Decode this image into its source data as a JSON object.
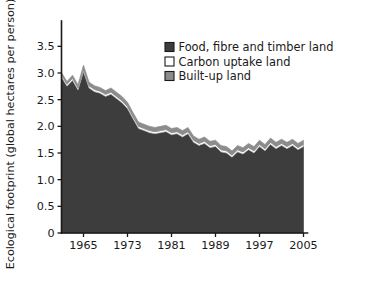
{
  "chart_data": {
    "type": "area",
    "stacked": true,
    "title": "",
    "subtitle": "",
    "xlabel": "",
    "ylabel": "Ecological footprint (global hectares per person)",
    "xlim": [
      1961,
      2005
    ],
    "ylim": [
      0,
      3.75
    ],
    "grid": false,
    "legend_position": "top-right",
    "y_ticks": [
      "0",
      "0.5",
      "1.0",
      "1.5",
      "2.0",
      "2.5",
      "3.0",
      "3.5"
    ],
    "y_tick_values": [
      0,
      0.5,
      1.0,
      1.5,
      2.0,
      2.5,
      3.0,
      3.5
    ],
    "x_ticks": [
      "1965",
      "1973",
      "1981",
      "1989",
      "1997",
      "2005"
    ],
    "x_tick_values": [
      1965,
      1973,
      1981,
      1989,
      1997,
      2005
    ],
    "x": [
      1961,
      1962,
      1963,
      1964,
      1965,
      1966,
      1967,
      1968,
      1969,
      1970,
      1971,
      1972,
      1973,
      1974,
      1975,
      1976,
      1977,
      1978,
      1979,
      1980,
      1981,
      1982,
      1983,
      1984,
      1985,
      1986,
      1987,
      1988,
      1989,
      1990,
      1991,
      1992,
      1993,
      1994,
      1995,
      1996,
      1997,
      1998,
      1999,
      2000,
      2001,
      2002,
      2003,
      2004,
      2005
    ],
    "series": [
      {
        "name": "Food, fibre and timber land",
        "color": "#3d3d3d",
        "values": [
          2.92,
          2.75,
          2.86,
          2.68,
          3.02,
          2.72,
          2.65,
          2.62,
          2.56,
          2.6,
          2.52,
          2.44,
          2.33,
          2.14,
          1.96,
          1.92,
          1.88,
          1.86,
          1.88,
          1.9,
          1.84,
          1.86,
          1.8,
          1.86,
          1.7,
          1.64,
          1.68,
          1.6,
          1.62,
          1.52,
          1.5,
          1.42,
          1.52,
          1.48,
          1.56,
          1.5,
          1.62,
          1.54,
          1.66,
          1.58,
          1.64,
          1.58,
          1.64,
          1.56,
          1.62
        ]
      },
      {
        "name": "Carbon uptake land",
        "color": "#ffffff",
        "values": [
          0.04,
          0.04,
          0.04,
          0.04,
          0.04,
          0.04,
          0.04,
          0.04,
          0.04,
          0.04,
          0.04,
          0.04,
          0.04,
          0.04,
          0.04,
          0.04,
          0.04,
          0.04,
          0.04,
          0.04,
          0.04,
          0.04,
          0.04,
          0.04,
          0.04,
          0.04,
          0.04,
          0.04,
          0.04,
          0.04,
          0.04,
          0.04,
          0.04,
          0.04,
          0.04,
          0.04,
          0.04,
          0.04,
          0.04,
          0.04,
          0.04,
          0.04,
          0.04,
          0.04,
          0.04
        ]
      },
      {
        "name": "Built-up land",
        "color": "#8c8c8c",
        "values": [
          0.05,
          0.05,
          0.06,
          0.06,
          0.09,
          0.07,
          0.07,
          0.07,
          0.07,
          0.08,
          0.08,
          0.08,
          0.08,
          0.08,
          0.08,
          0.08,
          0.08,
          0.08,
          0.08,
          0.08,
          0.08,
          0.08,
          0.08,
          0.08,
          0.08,
          0.08,
          0.08,
          0.08,
          0.08,
          0.08,
          0.08,
          0.08,
          0.08,
          0.08,
          0.08,
          0.08,
          0.08,
          0.08,
          0.08,
          0.08,
          0.08,
          0.08,
          0.08,
          0.08,
          0.08
        ]
      }
    ],
    "legend": [
      {
        "label": "Food, fibre and timber land",
        "color": "#3d3d3d"
      },
      {
        "label": "Carbon uptake land",
        "color": "#ffffff"
      },
      {
        "label": "Built-up land",
        "color": "#8c8c8c"
      }
    ]
  }
}
